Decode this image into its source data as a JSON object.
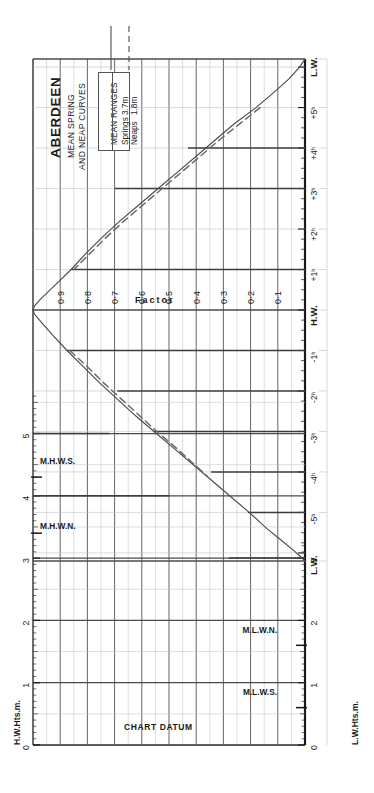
{
  "header": {
    "port": "ABERDEEN",
    "subtitle_line1": "MEAN SPRING",
    "subtitle_line2": "AND NEAP CURVES"
  },
  "legend": {
    "title": "MEAN RANGES",
    "rows": [
      {
        "label": "Springs",
        "value": "3.7m",
        "style": "solid"
      },
      {
        "label": "Neaps",
        "value": "1.8m",
        "style": "dashed"
      }
    ]
  },
  "labels": {
    "factor_axis": "Factor",
    "left_axis": "H.W.Hts.m.",
    "right_axis": "L.W.Hts.m.",
    "chart_datum": "CHART DATUM",
    "mhws": "M.H.W.S.",
    "mhwn": "M.H.W.N.",
    "mlwn": "M.L.W.N.",
    "mlws": "M.L.W.S."
  },
  "colors": {
    "ink": "#1a1a1a",
    "grid_major": "#4a4a4a",
    "grid_minor": "#b9bcc4",
    "curve_spring": "#4c4c4c",
    "curve_neap": "#6a6a6a"
  },
  "chart_data": {
    "type": "line",
    "subtitle": "Tidal curve — factor versus time from high water",
    "xlabel": "Factor",
    "ylabel": "Time relative to H.W.",
    "orientation": "factor-horizontal-time-vertical",
    "grid": true,
    "legend_position": "top-left",
    "factor_axis": {
      "label": "Factor",
      "ticks": [
        1.0,
        0.9,
        0.8,
        0.7,
        0.6,
        0.5,
        0.4,
        0.3,
        0.2,
        0.1,
        0.0
      ],
      "tick_labels": [
        "",
        "0·9",
        "0·8",
        "0·7",
        "0·6",
        "0·5",
        "0·4",
        "0·3",
        "0·2",
        "0·1",
        ""
      ],
      "range": [
        1.0,
        0.0
      ]
    },
    "time_axis": {
      "ticks": [
        "L.W.",
        "+5ʰ",
        "+4ʰ",
        "+3ʰ",
        "+2ʰ",
        "+1ʰ",
        "H.W.",
        "-1ʰ",
        "-2ʰ",
        "-3ʰ",
        "-4ʰ",
        "-5ʰ",
        "L.W."
      ],
      "minor_interval_minutes": 15,
      "range_hours": [
        6.2,
        -6.2
      ]
    },
    "height_axis_left": {
      "label": "H.W.Hts.m.",
      "ticks": [
        0,
        1,
        2,
        3,
        4,
        5
      ],
      "range": [
        0,
        5.6
      ],
      "markers": [
        {
          "name": "M.H.W.S.",
          "value": 4.3
        },
        {
          "name": "M.H.W.N.",
          "value": 3.4
        }
      ]
    },
    "height_axis_right": {
      "label": "L.W.Hts.m.",
      "ticks": [
        0,
        1,
        2,
        3
      ],
      "range": [
        0,
        3.2
      ],
      "markers": [
        {
          "name": "M.L.W.N.",
          "value": 1.6
        },
        {
          "name": "M.L.W.S.",
          "value": 0.6
        }
      ]
    },
    "series": [
      {
        "name": "Springs",
        "mean_range_m": 3.7,
        "style": "solid",
        "points_rising": [
          {
            "t": -6.2,
            "f": 0.0
          },
          {
            "t": -6.0,
            "f": 0.02
          },
          {
            "t": -5.7,
            "f": 0.06
          },
          {
            "t": -5.4,
            "f": 0.11
          },
          {
            "t": -5.0,
            "f": 0.18
          },
          {
            "t": -4.6,
            "f": 0.26
          },
          {
            "t": -4.2,
            "f": 0.33
          },
          {
            "t": -3.8,
            "f": 0.4
          },
          {
            "t": -3.4,
            "f": 0.47
          },
          {
            "t": -3.0,
            "f": 0.54
          },
          {
            "t": -2.6,
            "f": 0.61
          },
          {
            "t": -2.2,
            "f": 0.68
          },
          {
            "t": -1.8,
            "f": 0.745
          },
          {
            "t": -1.4,
            "f": 0.805
          },
          {
            "t": -1.0,
            "f": 0.86
          },
          {
            "t": -0.7,
            "f": 0.905
          },
          {
            "t": -0.45,
            "f": 0.945
          },
          {
            "t": -0.25,
            "f": 0.975
          },
          {
            "t": -0.1,
            "f": 0.995
          },
          {
            "t": 0.0,
            "f": 1.0
          }
        ],
        "points_falling": [
          {
            "t": 0.0,
            "f": 1.0
          },
          {
            "t": 0.1,
            "f": 0.995
          },
          {
            "t": 0.3,
            "f": 0.97
          },
          {
            "t": 0.6,
            "f": 0.93
          },
          {
            "t": 1.0,
            "f": 0.875
          },
          {
            "t": 1.4,
            "f": 0.815
          },
          {
            "t": 1.8,
            "f": 0.755
          },
          {
            "t": 2.2,
            "f": 0.69
          },
          {
            "t": 2.6,
            "f": 0.625
          },
          {
            "t": 3.0,
            "f": 0.555
          },
          {
            "t": 3.4,
            "f": 0.485
          },
          {
            "t": 3.8,
            "f": 0.415
          },
          {
            "t": 4.2,
            "f": 0.345
          },
          {
            "t": 4.6,
            "f": 0.275
          },
          {
            "t": 5.0,
            "f": 0.205
          },
          {
            "t": 5.4,
            "f": 0.14
          },
          {
            "t": 5.7,
            "f": 0.085
          },
          {
            "t": 5.95,
            "f": 0.04
          },
          {
            "t": 6.1,
            "f": 0.015
          },
          {
            "t": 6.2,
            "f": 0.0
          }
        ]
      },
      {
        "name": "Neaps",
        "mean_range_m": 1.8,
        "style": "dashed",
        "points_rising": [
          {
            "t": -5.0,
            "f": 0.165
          },
          {
            "t": -4.6,
            "f": 0.24
          },
          {
            "t": -4.2,
            "f": 0.315
          },
          {
            "t": -3.8,
            "f": 0.385
          },
          {
            "t": -3.4,
            "f": 0.455
          },
          {
            "t": -3.0,
            "f": 0.525
          },
          {
            "t": -2.6,
            "f": 0.595
          },
          {
            "t": -2.2,
            "f": 0.665
          },
          {
            "t": -1.8,
            "f": 0.73
          },
          {
            "t": -1.4,
            "f": 0.79
          },
          {
            "t": -1.0,
            "f": 0.85
          }
        ],
        "points_falling": [
          {
            "t": 1.0,
            "f": 0.865
          },
          {
            "t": 1.4,
            "f": 0.8
          },
          {
            "t": 1.8,
            "f": 0.74
          },
          {
            "t": 2.2,
            "f": 0.675
          },
          {
            "t": 2.6,
            "f": 0.61
          },
          {
            "t": 3.0,
            "f": 0.545
          },
          {
            "t": 3.4,
            "f": 0.475
          },
          {
            "t": 3.8,
            "f": 0.41
          },
          {
            "t": 4.1,
            "f": 0.36
          }
        ]
      }
    ],
    "worked_construction_lines": [
      {
        "from": "left-height 5.0",
        "to_factor": 0.72,
        "note": "H.W. height entry"
      },
      {
        "from": "left-height 4.0",
        "to_factor": 0.5,
        "note": "H.W. height entry"
      },
      {
        "from": "right-height 3.0",
        "to_factor": 0.28,
        "note": "L.W. height entry"
      },
      {
        "from": "time +5h",
        "to_factor": 0.21
      },
      {
        "from": "time +4h",
        "to_factor": 0.345
      },
      {
        "from": "time +3h",
        "to_factor": 0.555
      },
      {
        "from": "time +2h",
        "to_factor": 0.69
      },
      {
        "from": "time +1h",
        "to_factor": 0.875
      },
      {
        "from": "time -1h",
        "to_factor": 0.86
      },
      {
        "from": "time -3h",
        "to_factor": 0.7
      },
      {
        "from": "time -4h",
        "to_factor": 0.43
      }
    ]
  }
}
